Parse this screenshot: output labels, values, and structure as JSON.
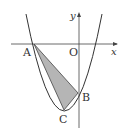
{
  "diagram": {
    "type": "parabola-with-triangle",
    "axes": {
      "x_label": "x",
      "y_label": "y",
      "origin_label": "O"
    },
    "points": {
      "A": {
        "label": "A"
      },
      "B": {
        "label": "B"
      },
      "C": {
        "label": "C"
      }
    },
    "colors": {
      "line": "#333333",
      "shade": "#b0b0b0",
      "background": "#ffffff"
    }
  }
}
